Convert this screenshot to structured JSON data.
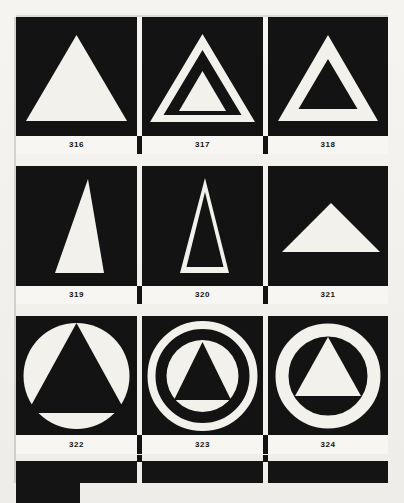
{
  "plate": {
    "background_color": "#f2f0ec",
    "ink_color": "#131313",
    "paper_color": "#f7f6f3",
    "caption_text_color": "#14120f",
    "columns": 3,
    "rows": 3
  },
  "figures": [
    {
      "number": "316",
      "caption": "316",
      "icon_name": "filled-triangle-icon",
      "description": "solid white equilateral triangle on black field",
      "shape": "triangle-filled",
      "fill": "#f3f1ec",
      "field": "#131313"
    },
    {
      "number": "317",
      "caption": "317",
      "icon_name": "nested-triangle-outline-icon",
      "description": "white triangle outline enclosing a smaller solid white triangle",
      "shape": "triangle-outline-with-inner-triangle",
      "fill": "#f3f1ec",
      "field": "#131313"
    },
    {
      "number": "318",
      "caption": "318",
      "icon_name": "thick-triangle-outline-icon",
      "description": "thick white triangular ring on black field",
      "shape": "triangle-outline",
      "fill": "#f3f1ec",
      "field": "#131313"
    },
    {
      "number": "319",
      "caption": "319",
      "icon_name": "tall-filled-triangle-icon",
      "description": "tall narrow solid white triangle on black field",
      "shape": "triangle-filled-tall",
      "fill": "#f3f1ec",
      "field": "#131313"
    },
    {
      "number": "320",
      "caption": "320",
      "icon_name": "tall-triangle-outline-icon",
      "description": "tall narrow white triangle outline on black field",
      "shape": "triangle-outline-tall",
      "fill": "#f3f1ec",
      "field": "#131313"
    },
    {
      "number": "321",
      "caption": "321",
      "icon_name": "wide-filled-triangle-icon",
      "description": "wide shallow solid white triangle on black field",
      "shape": "triangle-filled-wide",
      "fill": "#f3f1ec",
      "field": "#131313"
    },
    {
      "number": "322",
      "caption": "322",
      "icon_name": "circle-with-black-triangle-icon",
      "description": "solid white disc containing an inscribed black triangle",
      "shape": "disc-with-knockout-triangle",
      "fill": "#f3f1ec",
      "field": "#131313"
    },
    {
      "number": "323",
      "caption": "323",
      "icon_name": "double-ring-with-black-triangle-icon",
      "description": "white ring around a white disc containing a black triangle",
      "shape": "ring-and-disc-with-knockout-triangle",
      "fill": "#f3f1ec",
      "field": "#131313"
    },
    {
      "number": "324",
      "caption": "324",
      "icon_name": "ring-with-white-triangle-icon",
      "description": "thick white ring enclosing a solid white triangle on black",
      "shape": "ring-with-filled-triangle",
      "fill": "#f3f1ec",
      "field": "#131313"
    }
  ],
  "footer": {
    "note": "partial row of black plates cropped at the page edge"
  }
}
